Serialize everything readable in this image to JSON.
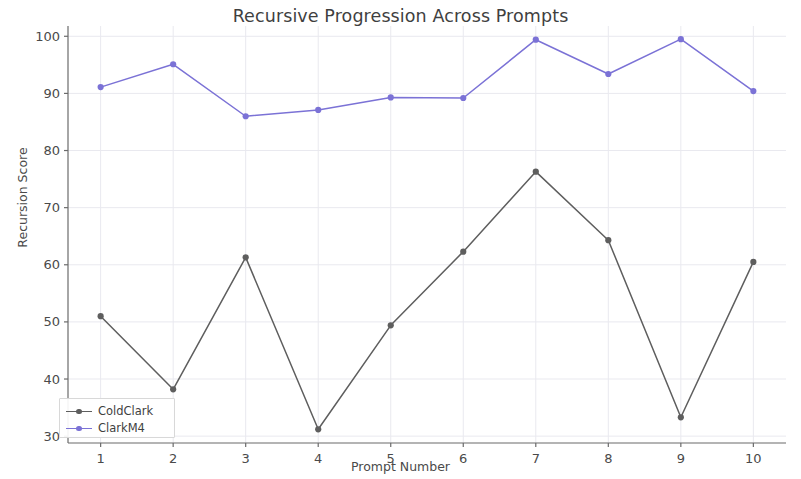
{
  "chart_data": {
    "type": "line",
    "title": "Recursive Progression Across Prompts",
    "xlabel": "Prompt Number",
    "ylabel": "Recursion Score",
    "x": [
      1,
      2,
      3,
      4,
      5,
      6,
      7,
      8,
      9,
      10
    ],
    "xtick_labels": [
      "1",
      "2",
      "3",
      "4",
      "5",
      "6",
      "7",
      "8",
      "9",
      "10"
    ],
    "ytick_labels": [
      "30",
      "40",
      "50",
      "60",
      "70",
      "80",
      "90",
      "100"
    ],
    "yticks": [
      30,
      40,
      50,
      60,
      70,
      80,
      90,
      100
    ],
    "xlim": [
      0.55,
      10.45
    ],
    "ylim": [
      28.8,
      101.8
    ],
    "grid": true,
    "grid_color": "#e9e9ef",
    "legend_position": "lower left",
    "series": [
      {
        "name": "ColdClark",
        "color": "#5e5e5e",
        "marker": "circle",
        "values": [
          51.0,
          38.2,
          61.3,
          31.2,
          49.4,
          62.3,
          76.3,
          64.3,
          33.3,
          60.5
        ]
      },
      {
        "name": "ClarkM4",
        "color": "#7b72d6",
        "marker": "circle",
        "values": [
          91.1,
          95.1,
          86.0,
          87.1,
          89.3,
          89.2,
          99.4,
          93.4,
          99.5,
          90.4
        ]
      }
    ]
  },
  "legend": {
    "entries": [
      {
        "label": "ColdClark"
      },
      {
        "label": "ClarkM4"
      }
    ]
  }
}
